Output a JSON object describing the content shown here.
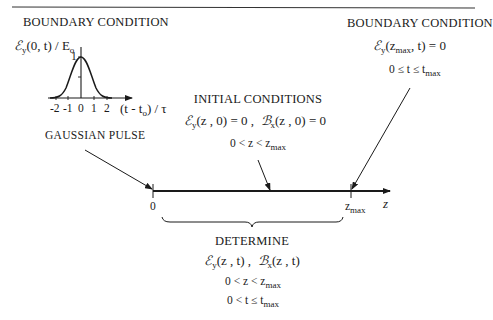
{
  "diagram": {
    "left_boundary": {
      "title": "BOUNDARY CONDITION",
      "graph": {
        "ylabel_symbol": "ℰ",
        "ylabel_sub": "y",
        "ylabel_rest": "(0, t) / E",
        "ylabel_sub2": "o",
        "y_tick_top": "1",
        "x_ticks": [
          "-2",
          "-1",
          "0",
          "1",
          "2"
        ],
        "xlabel_pre": "(t - t",
        "xlabel_sub": "o",
        "xlabel_post": ") / τ"
      },
      "pulse_label": "GAUSSIAN PULSE"
    },
    "initial_conditions": {
      "title": "INITIAL CONDITIONS",
      "eq_e_symbol": "ℰ",
      "eq_e_sub": "y",
      "eq_e_rest": "(z , 0) = 0 ,",
      "eq_b_symbol": "ℬ",
      "eq_b_sub": "x",
      "eq_b_rest": "(z , 0) = 0",
      "range_pre": "0 < z < z",
      "range_sub": "max"
    },
    "right_boundary": {
      "title": "BOUNDARY CONDITION",
      "eq_symbol": "ℰ",
      "eq_sub": "y",
      "eq_pre": "(z",
      "eq_sub2": "max",
      "eq_post": ", t) = 0",
      "range_pre": "0 ≤ t ≤ t",
      "range_sub": "max"
    },
    "axis": {
      "origin_label": "0",
      "end_label_pre": "z",
      "end_label_sub": "max",
      "axis_label": "z"
    },
    "determine": {
      "title": "DETERMINE",
      "eq_e_symbol": "ℰ",
      "eq_e_sub": "y",
      "eq_e_rest": "(z , t) ,",
      "eq_b_symbol": "ℬ",
      "eq_b_sub": "x",
      "eq_b_rest": "(z , t)",
      "range_z_pre": "0 < z < z",
      "range_z_sub": "max",
      "range_t_pre": "0 < t ≤ t",
      "range_t_sub": "max"
    }
  }
}
